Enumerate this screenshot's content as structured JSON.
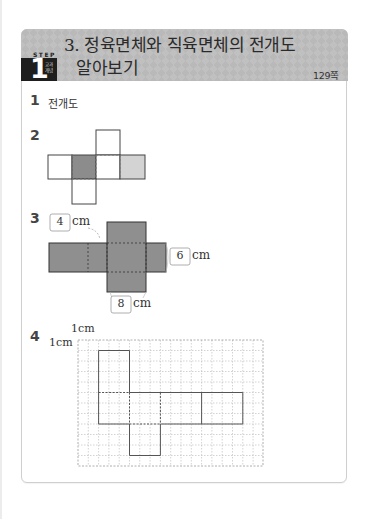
{
  "header": {
    "step_label": "STEP",
    "step_number": "1",
    "step_sub": "교과 개념",
    "title_line1": "3. 정육면체와 직육면체의 전개도",
    "title_line2": "알아보기",
    "page_ref": "129쪽"
  },
  "questions": [
    {
      "number": "1",
      "answer": "전개도"
    },
    {
      "number": "2",
      "figure": "cube-net-with-shaded-faces",
      "shading": [
        "none",
        "dark-gray",
        "none",
        "light-gray"
      ]
    },
    {
      "number": "3",
      "figure": "cuboid-net",
      "labels": [
        {
          "value": "4",
          "unit": "cm"
        },
        {
          "value": "6",
          "unit": "cm"
        },
        {
          "value": "8",
          "unit": "cm"
        }
      ]
    },
    {
      "number": "4",
      "figure": "cuboid-net-on-grid",
      "grid_label_x": "1cm",
      "grid_label_y": "1cm",
      "grid_cols": 18,
      "grid_rows": 12
    }
  ],
  "colors": {
    "banner": "#b9b9b9",
    "step_box": "#1e1e1e",
    "net_dark": "#8c8c8c",
    "net_light": "#d3d3d3",
    "net_fill_q3": "#8f8f8f",
    "grid_line": "#b5b5b5"
  }
}
